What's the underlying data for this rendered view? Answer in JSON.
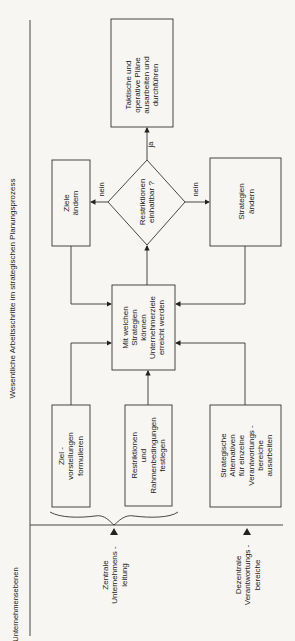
{
  "title": "Wesentliche Arbeitsschritte im strategischen Planungsprozess",
  "levels_heading": "Unternehmensebenen",
  "levels": [
    {
      "label": "Zentrale\nUnternehmens -\nleitung"
    },
    {
      "label": "Dezentrale\nVerantwortungs -\nbereiche"
    }
  ],
  "boxes": {
    "zielvorstellungen": "Ziel -\nvorstellungen\nformulieren",
    "restriktionen": "Restriktionen\nund\nRahmenbedingungen\nfestlegen",
    "alternativen": "Strategische\nAlternativen\nfür einzelne\nVerantwortungs -\nbereiche\nausarbeiten",
    "central": "Mit welchen\nStrategien\nkönnen\nUnternehmerziele\nerreicht werden",
    "ziele_aendern": "Ziele\nändern",
    "strategien_aendern": "Strategien\nändern",
    "taktische": "Taktische und\noperative Pläne\nausarbeiten und\ndurchführen"
  },
  "decision": "Restriktionen\neinhaltbar ?",
  "edge_labels": {
    "ja": "ja",
    "nein_left": "nein",
    "nein_right": "nein"
  },
  "colors": {
    "line": "#333333",
    "background": "#f7f6f2"
  }
}
